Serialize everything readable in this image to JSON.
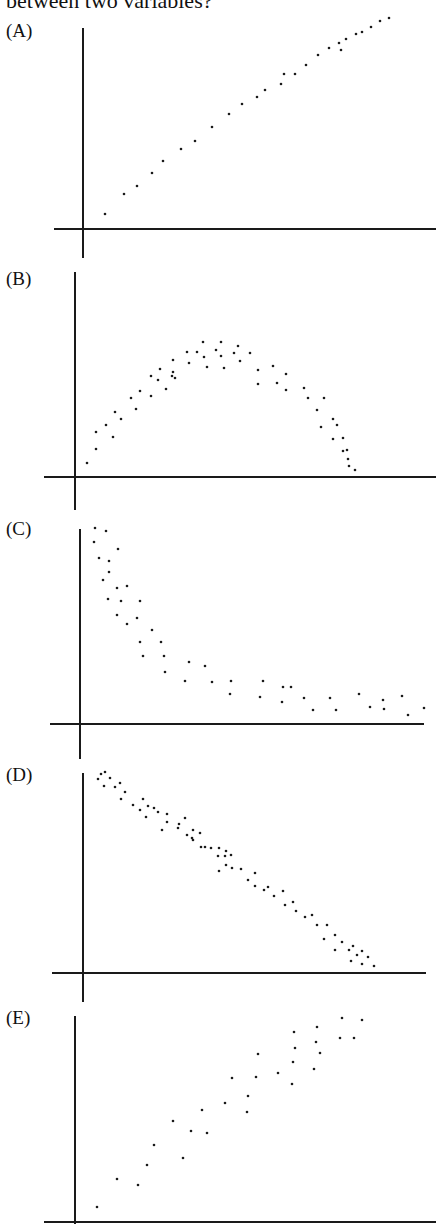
{
  "question": {
    "text": "between two variables?"
  },
  "chart_data": [
    {
      "type": "scatter",
      "label": "(A)",
      "title": "",
      "xlabel": "",
      "ylabel": "",
      "description": "Strong positive linear relationship",
      "axes": {
        "yaxis": {
          "x": 83,
          "y1": 28,
          "y2": 258
        },
        "xaxis": {
          "y": 229,
          "x1": 54,
          "x2": 436
        }
      },
      "label_pos": {
        "top": 20
      },
      "points": [
        [
          105,
          214
        ],
        [
          124,
          194
        ],
        [
          137,
          186
        ],
        [
          152,
          173
        ],
        [
          163,
          161
        ],
        [
          181,
          149
        ],
        [
          195,
          141
        ],
        [
          212,
          127
        ],
        [
          229,
          114
        ],
        [
          242,
          104
        ],
        [
          257,
          97
        ],
        [
          265,
          90
        ],
        [
          281,
          84
        ],
        [
          284,
          74
        ],
        [
          295,
          74
        ],
        [
          306,
          65
        ],
        [
          318,
          55
        ],
        [
          329,
          48
        ],
        [
          339,
          43
        ],
        [
          341,
          50
        ],
        [
          346,
          39
        ],
        [
          356,
          34
        ],
        [
          362,
          32
        ],
        [
          371,
          27
        ],
        [
          380,
          21
        ],
        [
          389,
          18
        ]
      ]
    },
    {
      "type": "scatter",
      "label": "(B)",
      "title": "",
      "xlabel": "",
      "ylabel": "",
      "description": "Curved (inverted-U) relationship",
      "axes": {
        "yaxis": {
          "x": 75,
          "y1": 272,
          "y2": 510
        },
        "xaxis": {
          "y": 477,
          "x1": 44,
          "x2": 436
        }
      },
      "label_pos": {
        "top": 268
      },
      "points": [
        [
          87,
          463
        ],
        [
          96,
          449
        ],
        [
          96,
          432
        ],
        [
          106,
          425
        ],
        [
          113,
          437
        ],
        [
          115,
          412
        ],
        [
          121,
          419
        ],
        [
          131,
          398
        ],
        [
          136,
          409
        ],
        [
          140,
          391
        ],
        [
          151,
          396
        ],
        [
          151,
          376
        ],
        [
          158,
          380
        ],
        [
          160,
          369
        ],
        [
          166,
          389
        ],
        [
          172,
          376
        ],
        [
          173,
          360
        ],
        [
          173,
          372
        ],
        [
          175,
          378
        ],
        [
          187,
          352
        ],
        [
          189,
          363
        ],
        [
          197,
          352
        ],
        [
          203,
          342
        ],
        [
          204,
          357
        ],
        [
          207,
          367
        ],
        [
          216,
          350
        ],
        [
          221,
          342
        ],
        [
          221,
          356
        ],
        [
          224,
          368
        ],
        [
          234,
          353
        ],
        [
          238,
          346
        ],
        [
          240,
          361
        ],
        [
          250,
          353
        ],
        [
          258,
          370
        ],
        [
          258,
          384
        ],
        [
          273,
          366
        ],
        [
          277,
          383
        ],
        [
          286,
          374
        ],
        [
          286,
          390
        ],
        [
          304,
          388
        ],
        [
          308,
          398
        ],
        [
          317,
          410
        ],
        [
          321,
          427
        ],
        [
          324,
          398
        ],
        [
          333,
          419
        ],
        [
          333,
          439
        ],
        [
          337,
          425
        ],
        [
          343,
          438
        ],
        [
          343,
          451
        ],
        [
          347,
          450
        ],
        [
          348,
          459
        ],
        [
          349,
          466
        ],
        [
          355,
          470
        ]
      ]
    },
    {
      "type": "scatter",
      "label": "(C)",
      "title": "",
      "xlabel": "",
      "ylabel": "",
      "description": "Negative nonlinear (decaying) relationship",
      "axes": {
        "yaxis": {
          "x": 80,
          "y1": 529,
          "y2": 759
        },
        "xaxis": {
          "y": 724,
          "x1": 50,
          "x2": 424
        }
      },
      "label_pos": {
        "top": 518
      },
      "points": [
        [
          95,
          528
        ],
        [
          106,
          531
        ],
        [
          94,
          542
        ],
        [
          118,
          549
        ],
        [
          99,
          558
        ],
        [
          109,
          561
        ],
        [
          109,
          572
        ],
        [
          103,
          580
        ],
        [
          117,
          588
        ],
        [
          127,
          586
        ],
        [
          108,
          599
        ],
        [
          121,
          601
        ],
        [
          140,
          601
        ],
        [
          117,
          615
        ],
        [
          137,
          618
        ],
        [
          127,
          624
        ],
        [
          152,
          630
        ],
        [
          140,
          642
        ],
        [
          161,
          642
        ],
        [
          143,
          656
        ],
        [
          164,
          656
        ],
        [
          165,
          672
        ],
        [
          189,
          662
        ],
        [
          205,
          666
        ],
        [
          185,
          681
        ],
        [
          212,
          682
        ],
        [
          231,
          681
        ],
        [
          263,
          681
        ],
        [
          230,
          694
        ],
        [
          260,
          697
        ],
        [
          283,
          687
        ],
        [
          291,
          687
        ],
        [
          282,
          702
        ],
        [
          304,
          698
        ],
        [
          313,
          710
        ],
        [
          330,
          698
        ],
        [
          336,
          710
        ],
        [
          359,
          694
        ],
        [
          370,
          707
        ],
        [
          383,
          700
        ],
        [
          384,
          709
        ],
        [
          402,
          696
        ],
        [
          408,
          715
        ],
        [
          424,
          708
        ]
      ]
    },
    {
      "type": "scatter",
      "label": "(D)",
      "title": "",
      "xlabel": "",
      "ylabel": "",
      "description": "Strong negative linear relationship",
      "axes": {
        "yaxis": {
          "x": 83,
          "y1": 773,
          "y2": 1002
        },
        "xaxis": {
          "y": 973,
          "x1": 52,
          "x2": 426
        }
      },
      "label_pos": {
        "top": 764
      },
      "points": [
        [
          98,
          779
        ],
        [
          101,
          774
        ],
        [
          105,
          772
        ],
        [
          110,
          778
        ],
        [
          104,
          786
        ],
        [
          115,
          787
        ],
        [
          120,
          783
        ],
        [
          125,
          792
        ],
        [
          121,
          799
        ],
        [
          133,
          805
        ],
        [
          143,
          799
        ],
        [
          140,
          810
        ],
        [
          148,
          806
        ],
        [
          146,
          817
        ],
        [
          154,
          808
        ],
        [
          158,
          812
        ],
        [
          167,
          814
        ],
        [
          167,
          822
        ],
        [
          162,
          830
        ],
        [
          179,
          824
        ],
        [
          185,
          818
        ],
        [
          178,
          828
        ],
        [
          193,
          830
        ],
        [
          187,
          835
        ],
        [
          192,
          838
        ],
        [
          193,
          840
        ],
        [
          200,
          833
        ],
        [
          201,
          847
        ],
        [
          205,
          847
        ],
        [
          211,
          848
        ],
        [
          219,
          848
        ],
        [
          218,
          856
        ],
        [
          226,
          851
        ],
        [
          219,
          871
        ],
        [
          225,
          856
        ],
        [
          231,
          855
        ],
        [
          226,
          865
        ],
        [
          232,
          868
        ],
        [
          241,
          869
        ],
        [
          248,
          880
        ],
        [
          255,
          873
        ],
        [
          255,
          886
        ],
        [
          264,
          890
        ],
        [
          268,
          887
        ],
        [
          274,
          896
        ],
        [
          283,
          891
        ],
        [
          285,
          905
        ],
        [
          293,
          902
        ],
        [
          296,
          911
        ],
        [
          305,
          917
        ],
        [
          312,
          915
        ],
        [
          317,
          925
        ],
        [
          327,
          925
        ],
        [
          324,
          939
        ],
        [
          335,
          935
        ],
        [
          335,
          950
        ],
        [
          342,
          942
        ],
        [
          349,
          950
        ],
        [
          353,
          946
        ],
        [
          351,
          961
        ],
        [
          357,
          955
        ],
        [
          362,
          964
        ],
        [
          362,
          951
        ],
        [
          368,
          957
        ],
        [
          374,
          966
        ]
      ]
    },
    {
      "type": "scatter",
      "label": "(E)",
      "title": "",
      "xlabel": "",
      "ylabel": "",
      "description": "Moderate positive linear relationship with more scatter",
      "axes": {
        "yaxis": {
          "x": 75,
          "y1": 1016,
          "y2": 1224
        },
        "xaxis": {
          "y": 1222,
          "x1": 44,
          "x2": 436
        }
      },
      "label_pos": {
        "top": 1007
      },
      "points": [
        [
          97,
          1207
        ],
        [
          117,
          1179
        ],
        [
          138,
          1185
        ],
        [
          147,
          1165
        ],
        [
          154,
          1145
        ],
        [
          173,
          1121
        ],
        [
          183,
          1158
        ],
        [
          191,
          1131
        ],
        [
          202,
          1110
        ],
        [
          207,
          1133
        ],
        [
          225,
          1103
        ],
        [
          232,
          1078
        ],
        [
          247,
          1112
        ],
        [
          248,
          1096
        ],
        [
          256,
          1077
        ],
        [
          258,
          1054
        ],
        [
          278,
          1073
        ],
        [
          292,
          1084
        ],
        [
          293,
          1062
        ],
        [
          294,
          1032
        ],
        [
          295,
          1048
        ],
        [
          314,
          1069
        ],
        [
          316,
          1042
        ],
        [
          317,
          1027
        ],
        [
          320,
          1053
        ],
        [
          340,
          1038
        ],
        [
          342,
          1018
        ],
        [
          354,
          1038
        ],
        [
          362,
          1020
        ]
      ]
    }
  ]
}
